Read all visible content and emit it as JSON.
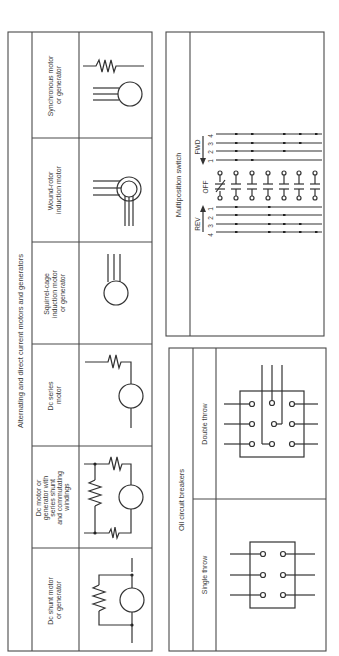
{
  "motors_table": {
    "title": "Alternating and direct current motors and generators",
    "rows": [
      {
        "label_lines": [
          "Synchronous motor",
          "or generator"
        ],
        "symbol": "synchronous-motor"
      },
      {
        "label_lines": [
          "Wound-rotor",
          "induction motor"
        ],
        "symbol": "wound-rotor-motor"
      },
      {
        "label_lines": [
          "Squirrel-cage",
          "induction motor",
          "or generator"
        ],
        "symbol": "squirrel-cage-motor"
      },
      {
        "label_lines": [
          "Dc series",
          "motor"
        ],
        "symbol": "dc-series-motor"
      },
      {
        "label_lines": [
          "Dc motor or",
          "generator with",
          "series shunt",
          "and commutating",
          "windings"
        ],
        "symbol": "dc-compound-motor"
      },
      {
        "label_lines": [
          "Dc shunt motor",
          "or generator"
        ],
        "symbol": "dc-shunt-motor"
      }
    ]
  },
  "switch_table": {
    "title": "Multiposition switch",
    "fwd_label": "FWD",
    "rev_label": "REV",
    "off_label": "OFF",
    "fwd_positions": [
      "4",
      "3",
      "2",
      "1"
    ],
    "rev_positions": [
      "1",
      "2",
      "3",
      "4"
    ],
    "contact_count": 7
  },
  "breakers_table": {
    "title": "Oil circuit breakers",
    "rows": [
      {
        "label": "Double throw",
        "symbol": "double-throw-breaker"
      },
      {
        "label": "Single throw",
        "symbol": "single-throw-breaker"
      }
    ]
  }
}
